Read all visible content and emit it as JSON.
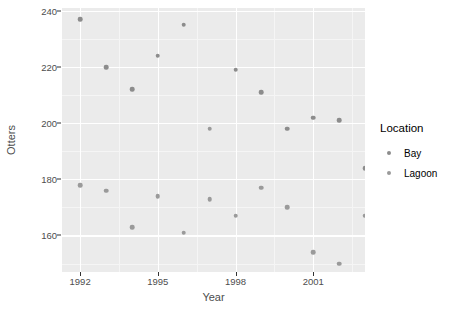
{
  "chart_data": {
    "type": "scatter",
    "title": "",
    "xlabel": "Year",
    "ylabel": "Otters",
    "xlim": [
      1991.3,
      2003.0
    ],
    "ylim": [
      147.0,
      241.0
    ],
    "xticks": [
      1992,
      1995,
      1998,
      2001
    ],
    "yticks": [
      160,
      180,
      200,
      220,
      240
    ],
    "grid": true,
    "legend": {
      "title": "Location",
      "position": "right",
      "entries": [
        "Bay",
        "Lagoon"
      ]
    },
    "series": [
      {
        "name": "Bay",
        "color": "#8c8c8c",
        "points": [
          {
            "x": 1992,
            "y": 237
          },
          {
            "x": 1993,
            "y": 220
          },
          {
            "x": 1994,
            "y": 212
          },
          {
            "x": 1995,
            "y": 224
          },
          {
            "x": 1996,
            "y": 235
          },
          {
            "x": 1998,
            "y": 219
          },
          {
            "x": 1999,
            "y": 211
          },
          {
            "x": 2000,
            "y": 198
          },
          {
            "x": 2001,
            "y": 202
          },
          {
            "x": 2002,
            "y": 201
          },
          {
            "x": 2003,
            "y": 184
          }
        ]
      },
      {
        "name": "Lagoon",
        "color": "#9a9a9a",
        "points": [
          {
            "x": 1992,
            "y": 178
          },
          {
            "x": 1993,
            "y": 176
          },
          {
            "x": 1994,
            "y": 163
          },
          {
            "x": 1995,
            "y": 174
          },
          {
            "x": 1996,
            "y": 161
          },
          {
            "x": 1997,
            "y": 198
          },
          {
            "x": 1997,
            "y": 173
          },
          {
            "x": 1998,
            "y": 167
          },
          {
            "x": 1999,
            "y": 177
          },
          {
            "x": 2000,
            "y": 170
          },
          {
            "x": 2001,
            "y": 154
          },
          {
            "x": 2002,
            "y": 150
          },
          {
            "x": 2003,
            "y": 167
          }
        ]
      }
    ]
  },
  "axes": {
    "y_title": "Otters",
    "x_title": "Year",
    "y_tick_labels": [
      "240",
      "220",
      "200",
      "180",
      "160"
    ],
    "x_tick_labels": [
      "1992",
      "1995",
      "1998",
      "2001"
    ]
  },
  "legend": {
    "title": "Location",
    "items": [
      {
        "label": "Bay",
        "color": "#8c8c8c"
      },
      {
        "label": "Lagoon",
        "color": "#9a9a9a"
      }
    ]
  },
  "theme": {
    "panel_bg": "#ebebeb",
    "grid_major": "#ffffff",
    "grid_minor": "#f5f5f5",
    "text": "#4d4d4d",
    "page_bg": "#ffffff"
  }
}
